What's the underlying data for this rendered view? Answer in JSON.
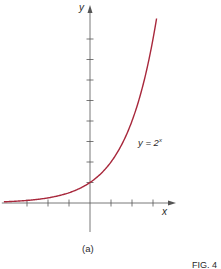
{
  "chart_data": {
    "type": "line",
    "title": "",
    "xlabel": "x",
    "ylabel": "y",
    "series": [
      {
        "name": "y = 2^x",
        "function": "2^x",
        "color": "#a8283c",
        "x": [
          -4,
          -3,
          -2,
          -1,
          0,
          1,
          2,
          3,
          3.17
        ],
        "values": [
          0.0625,
          0.125,
          0.25,
          0.5,
          1,
          2,
          4,
          8,
          9
        ]
      }
    ],
    "annotation": {
      "text_base": "y = 2",
      "text_exp": "x"
    },
    "xlim": [
      -4.2,
      4.1
    ],
    "ylim": [
      -1.4,
      9.2
    ],
    "x_ticks": [
      -3,
      -2,
      -1,
      1,
      2,
      3
    ],
    "y_ticks": [
      1,
      2,
      3,
      4,
      5,
      6,
      7,
      8
    ],
    "tick_labels_shown": false,
    "grid": false,
    "legend": "none"
  },
  "labels": {
    "x_axis": "x",
    "y_axis": "y",
    "panel": "(a)",
    "figure": "FIG. 4"
  },
  "colors": {
    "curve": "#a8283c",
    "axis": "#555555",
    "text": "#2a2a2a"
  }
}
